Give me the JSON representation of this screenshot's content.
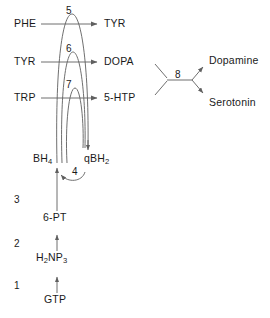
{
  "diagram": {
    "colors": {
      "background": "#ffffff",
      "stroke": "#5f5f5f",
      "text": "#1a1a1a"
    },
    "hydroxylation_reactions": [
      {
        "step": "5",
        "substrate": "PHE",
        "product": "TYR",
        "substrate_x": 14,
        "substrate_y": 20,
        "product_x": 104,
        "product_y": 20,
        "number_x": 66,
        "number_y": 8,
        "arrow_y": 24,
        "arrow_x1": 41,
        "arrow_x2": 99
      },
      {
        "step": "6",
        "substrate": "TYR",
        "product": "DOPA",
        "substrate_x": 14,
        "substrate_y": 58,
        "product_x": 104,
        "product_y": 58,
        "number_x": 66,
        "number_y": 46,
        "arrow_y": 62,
        "arrow_x1": 41,
        "arrow_x2": 99
      },
      {
        "step": "7",
        "substrate": "TRP",
        "product": "5-HTP",
        "substrate_x": 14,
        "substrate_y": 94,
        "product_x": 104,
        "product_y": 94,
        "number_x": 66,
        "number_y": 82,
        "arrow_y": 98,
        "arrow_x1": 41,
        "arrow_x2": 99
      }
    ],
    "cofactor_cycle": {
      "reduced_form": "BH",
      "reduced_form_sub": "4",
      "oxidized_form": "qBH",
      "oxidized_form_sub": "2",
      "regeneration_step": "4",
      "bh4_x": 49,
      "bh4_y": 160,
      "qbh2_x": 88,
      "qbh2_y": 160,
      "step_x": 76,
      "step_y": 170
    },
    "biosynthesis_chain": [
      {
        "step": "1",
        "from": "GTP",
        "to": "H2NP3",
        "label": "GTP",
        "label_x": 57,
        "label_y": 300,
        "number_x": 14,
        "number_y": 285
      },
      {
        "step": "2",
        "from": "H2NP3",
        "to": "6-PT",
        "label": "H",
        "label_x": 52,
        "label_y": 258,
        "number_x": 14,
        "number_y": 243
      },
      {
        "step": "3",
        "from": "6-PT",
        "to": "BH4",
        "label": "6-PT",
        "label_x": 55,
        "label_y": 218,
        "number_x": 14,
        "number_y": 198
      }
    ],
    "biosynthesis_labels": {
      "gtp": "GTP",
      "h2np3_main1": "H",
      "h2np3_sub1": "2",
      "h2np3_main2": "NP",
      "h2np3_sub2": "3",
      "six_pt": "6-PT"
    },
    "decarboxylation": {
      "step": "8",
      "step_x": 178,
      "step_y": 74,
      "products": [
        {
          "name": "Dopamine",
          "x": 210,
          "y": 57
        },
        {
          "name": "Serotonin",
          "x": 210,
          "y": 99
        }
      ]
    }
  }
}
